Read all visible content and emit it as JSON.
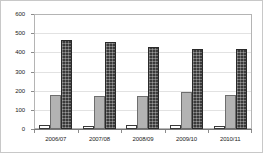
{
  "chart_data": {
    "type": "bar",
    "title": "",
    "subtitle": "",
    "xlabel": "",
    "ylabel": "",
    "categories": [
      "2006/07",
      "2007/08",
      "2008/09",
      "2009/10",
      "2010/11"
    ],
    "series": [
      {
        "name": "series-1",
        "color": "#ffffff",
        "values": [
          21,
          17,
          20,
          23,
          15
        ]
      },
      {
        "name": "series-2",
        "color": "#b3b3b3",
        "values": [
          179,
          170,
          173,
          192,
          175
        ]
      },
      {
        "name": "series-3",
        "color": "#3a3a3a",
        "values": [
          465,
          455,
          426,
          418,
          418
        ]
      }
    ],
    "ylim": [
      0,
      600
    ],
    "ytick_labels": [
      "600",
      "500",
      "400",
      "300",
      "200",
      "100",
      "0"
    ],
    "ytick_values": [
      600,
      500,
      400,
      300,
      200,
      100,
      0
    ],
    "grid": true,
    "grid_axis": "y",
    "legend": false,
    "legend_position": "none",
    "annotations": []
  }
}
